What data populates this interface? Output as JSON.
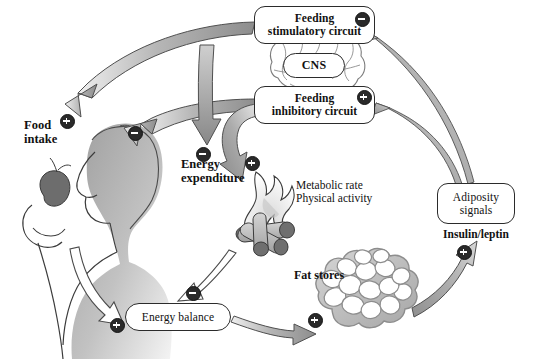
{
  "diagram": {
    "background_color": "#ffffff",
    "arrow_fill_color": "#9a9a9a",
    "outline_arrow_color": "#ffffff",
    "node_border_color": "#2b2b2b",
    "badge_color": "#2a2a2a"
  },
  "nodes": {
    "feeding_stimulatory": {
      "line1": "Feeding",
      "line2": "stimulatory circuit"
    },
    "feeding_inhibitory": {
      "line1": "Feeding",
      "line2": "inhibitory circuit"
    },
    "cns": {
      "label": "CNS"
    },
    "adiposity": {
      "line1": "Adiposity",
      "line2": "signals"
    },
    "energy_balance": {
      "label": "Energy balance"
    }
  },
  "labels": {
    "food_intake": {
      "line1": "Food",
      "line2": "intake"
    },
    "energy_expenditure": {
      "line1": "Energy",
      "line2": "expenditure"
    },
    "metabolic": {
      "line1": "Metabolic rate",
      "line2": "Physical activity"
    },
    "fat_stores": {
      "label": "Fat stores"
    },
    "insulin_leptin": {
      "label": "Insulin/leptin"
    }
  },
  "signs": [
    {
      "id": "sign-stim-to-food",
      "type": "+",
      "symbol": "+",
      "x": 60,
      "y": 114,
      "meaning": "feeding stimulatory circuit increases food intake"
    },
    {
      "id": "sign-inhib-to-food",
      "type": "-",
      "symbol": "−",
      "x": 128,
      "y": 126,
      "meaning": "feeding inhibitory circuit decreases food intake"
    },
    {
      "id": "sign-stim-to-expenditure",
      "type": "-",
      "symbol": "−",
      "x": 196,
      "y": 147,
      "meaning": "feeding stimulatory circuit decreases energy expenditure"
    },
    {
      "id": "sign-inhib-to-expenditure",
      "type": "+",
      "symbol": "+",
      "x": 245,
      "y": 156,
      "meaning": "feeding inhibitory circuit increases energy expenditure"
    },
    {
      "id": "sign-adiposity-to-stim",
      "type": "-",
      "symbol": "−",
      "x": 355,
      "y": 12,
      "meaning": "adiposity signals inhibit the feeding stimulatory circuit"
    },
    {
      "id": "sign-adiposity-to-inhib",
      "type": "+",
      "symbol": "+",
      "x": 357,
      "y": 90,
      "meaning": "adiposity signals activate the feeding inhibitory circuit"
    },
    {
      "id": "sign-food-to-balance",
      "type": "+",
      "symbol": "+",
      "x": 110,
      "y": 318,
      "meaning": "food intake increases energy balance"
    },
    {
      "id": "sign-expenditure-to-balance",
      "type": "-",
      "symbol": "−",
      "x": 186,
      "y": 286,
      "meaning": "energy expenditure decreases energy balance"
    },
    {
      "id": "sign-balance-to-fat",
      "type": "+",
      "symbol": "+",
      "x": 308,
      "y": 313,
      "meaning": "positive energy balance increases fat stores"
    },
    {
      "id": "sign-fat-to-adiposity",
      "type": "+",
      "symbol": "+",
      "x": 457,
      "y": 245,
      "meaning": "fat stores increase adiposity signals"
    }
  ],
  "illustrations": [
    {
      "name": "person-eating-apple",
      "description": "shaded silhouette of a person holding an apple"
    },
    {
      "name": "brain",
      "description": "line drawing of a human brain behind the CNS oval"
    },
    {
      "name": "campfire",
      "description": "burning logs representing energy expenditure"
    },
    {
      "name": "adipocytes",
      "description": "cluster of fat cells representing fat stores"
    }
  ]
}
